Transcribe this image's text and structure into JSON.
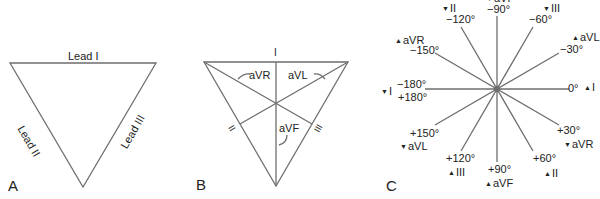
{
  "colors": {
    "line": "#6e6e6e",
    "text": "#222222",
    "background": "#ffffff"
  },
  "panels": {
    "A": {
      "letter": "A",
      "edges": {
        "top": "Lead I",
        "left": "Lead II",
        "right": "Lead III"
      }
    },
    "B": {
      "letter": "B",
      "edge_labels": {
        "top": "I",
        "left": "II",
        "right": "III"
      },
      "augmented": {
        "avr": "aVR",
        "avl": "aVL",
        "avf": "aVF"
      }
    },
    "C": {
      "letter": "C",
      "axes": [
        {
          "angle": "0°",
          "lead": "I",
          "marker": "▲"
        },
        {
          "angle": "+30°",
          "lead": "aVR",
          "marker": "▼"
        },
        {
          "angle": "+60°",
          "lead": "II",
          "marker": "▲"
        },
        {
          "angle": "+90°",
          "lead": "aVF",
          "marker": "▲"
        },
        {
          "angle": "+120°",
          "lead": "III",
          "marker": "▲"
        },
        {
          "angle": "+150°",
          "lead": "aVL",
          "marker": "▼"
        },
        {
          "angle": "−180°",
          "angle2": "+180°",
          "lead": "I",
          "marker": "▼"
        },
        {
          "angle": "−150°",
          "lead": "aVR",
          "marker": "▲"
        },
        {
          "angle": "−120°",
          "lead": "II",
          "marker": "▼"
        },
        {
          "angle": "−90°",
          "lead": "aVF",
          "marker": "▼"
        },
        {
          "angle": "−60°",
          "lead": "III",
          "marker": "▼"
        },
        {
          "angle": "−30°",
          "lead": "aVL",
          "marker": "▲"
        }
      ]
    }
  }
}
